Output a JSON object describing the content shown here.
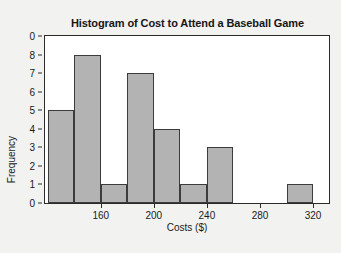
{
  "figure": {
    "background_color": "#f2f2f1",
    "panel_color": "#ffffff",
    "frame_color": "#2b2b2b"
  },
  "chart_data": {
    "type": "bar",
    "title": "Histogram of Cost to Attend a Baseball Game",
    "xlabel": "Costs ($)",
    "ylabel": "Frequency",
    "grid": false,
    "legend": false,
    "bar_color": "#b3b3b3",
    "bar_edge_color": "#3c3c3c",
    "bin_width": 20,
    "xlim": [
      118,
      332
    ],
    "ylim": [
      0,
      9
    ],
    "ytick_labels": [
      "0",
      "8",
      "7",
      "6",
      "5",
      "4",
      "3",
      "2",
      "1",
      "0"
    ],
    "ytick_values": [
      9,
      8,
      7,
      6,
      5,
      4,
      3,
      2,
      1,
      0
    ],
    "xtick_labels": [
      "160",
      "200",
      "240",
      "280",
      "320"
    ],
    "xtick_values": [
      160,
      200,
      240,
      280,
      320
    ],
    "bins": [
      {
        "start": 120,
        "end": 140,
        "value": 5
      },
      {
        "start": 140,
        "end": 160,
        "value": 8
      },
      {
        "start": 160,
        "end": 180,
        "value": 1
      },
      {
        "start": 180,
        "end": 200,
        "value": 7
      },
      {
        "start": 200,
        "end": 220,
        "value": 4
      },
      {
        "start": 220,
        "end": 240,
        "value": 1
      },
      {
        "start": 240,
        "end": 260,
        "value": 3
      },
      {
        "start": 260,
        "end": 280,
        "value": 0
      },
      {
        "start": 280,
        "end": 300,
        "value": 0
      },
      {
        "start": 300,
        "end": 320,
        "value": 1
      }
    ],
    "categories": [
      "120-140",
      "140-160",
      "160-180",
      "180-200",
      "200-220",
      "220-240",
      "240-260",
      "260-280",
      "280-300",
      "300-320"
    ],
    "values": [
      5,
      8,
      1,
      7,
      4,
      1,
      3,
      0,
      0,
      1
    ]
  }
}
